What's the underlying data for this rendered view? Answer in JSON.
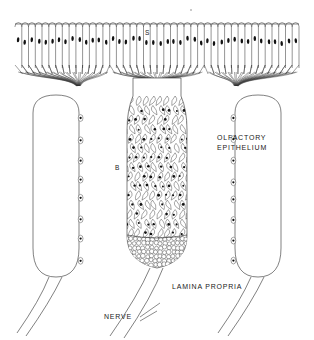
{
  "figure": {
    "labels": {
      "supporting_cell": "S",
      "basal_cell": "B",
      "olfactory_epithelium_line1": "OLFACTORY",
      "olfactory_epithelium_line2": "EPITHELIUM",
      "lamina_propria": "LAMINA PROPRIA",
      "nerve": "NERVE"
    },
    "colors": {
      "ink": "#1a1a1a",
      "line": "#2b2b2b",
      "nucleus": "#111111",
      "background": "#ffffff",
      "faint": "#b9b9b9"
    },
    "structures": [
      {
        "name": "epithelial-cell-row",
        "count": 42,
        "description": "columnar supporting cells with dark oval nuclei"
      },
      {
        "name": "axon-bundle-left",
        "description": "converging olfactory axons, left"
      },
      {
        "name": "axon-bundle-center",
        "description": "converging olfactory axons, center"
      },
      {
        "name": "axon-bundle-right",
        "description": "converging olfactory axons, right"
      },
      {
        "name": "gland-left",
        "description": "stadium-shaped gland / Bowman duct, left"
      },
      {
        "name": "gland-right",
        "description": "stadium-shaped gland / Bowman duct, right"
      },
      {
        "name": "central-column",
        "description": "meshwork column of olfactory cells"
      },
      {
        "name": "cell-cluster-base",
        "description": "densely packed round cells at column base"
      },
      {
        "name": "nerve-fiber-pairs",
        "count": 3,
        "description": "paired curved nerve fibres descending"
      }
    ]
  }
}
